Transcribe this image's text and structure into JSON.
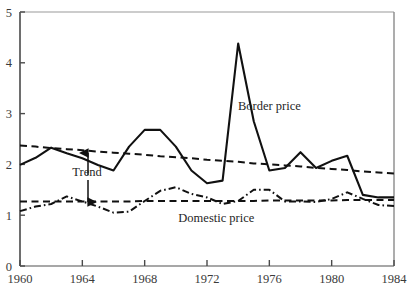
{
  "chart_data": {
    "type": "line",
    "title": "",
    "subtitle": "",
    "xlabel": "",
    "ylabel": "",
    "xlim": [
      1960,
      1984
    ],
    "ylim": [
      0,
      5
    ],
    "grid": false,
    "legend_position": "inline-annotations",
    "x_ticks": [
      "1960",
      "1964",
      "1968",
      "1972",
      "1976",
      "1980",
      "1984"
    ],
    "x_tick_values": [
      1960,
      1964,
      1968,
      1972,
      1976,
      1980,
      1984
    ],
    "y_ticks": [
      "0",
      "1",
      "2",
      "3",
      "4",
      "5"
    ],
    "y_tick_values": [
      0,
      1,
      2,
      3,
      4,
      5
    ],
    "x": [
      1960,
      1961,
      1962,
      1963,
      1964,
      1965,
      1966,
      1967,
      1968,
      1969,
      1970,
      1971,
      1972,
      1973,
      1974,
      1975,
      1976,
      1977,
      1978,
      1979,
      1980,
      1981,
      1982,
      1983,
      1984
    ],
    "series": [
      {
        "name": "Border price",
        "style": "solid",
        "color": "#111111",
        "values": [
          1.99,
          2.13,
          2.33,
          2.22,
          2.12,
          1.99,
          1.88,
          2.35,
          2.68,
          2.68,
          2.35,
          1.88,
          1.63,
          1.68,
          4.38,
          2.85,
          1.88,
          1.93,
          2.24,
          1.93,
          2.07,
          2.17,
          1.4,
          1.35,
          1.35
        ]
      },
      {
        "name": "Domestic price",
        "style": "dash-dot",
        "color": "#111111",
        "values": [
          1.08,
          1.17,
          1.22,
          1.37,
          1.27,
          1.17,
          1.05,
          1.07,
          1.28,
          1.48,
          1.55,
          1.42,
          1.35,
          1.22,
          1.28,
          1.5,
          1.5,
          1.27,
          1.27,
          1.26,
          1.32,
          1.45,
          1.32,
          1.2,
          1.18
        ]
      },
      {
        "name": "Border price trend",
        "style": "dashed",
        "color": "#111111",
        "values": [
          2.37,
          2.35,
          2.32,
          2.3,
          2.28,
          2.25,
          2.23,
          2.21,
          2.19,
          2.16,
          2.14,
          2.12,
          2.09,
          2.07,
          2.05,
          2.02,
          2.0,
          1.98,
          1.96,
          1.93,
          1.91,
          1.89,
          1.86,
          1.84,
          1.82
        ]
      },
      {
        "name": "Domestic price trend",
        "style": "dashed",
        "color": "#111111",
        "values": [
          1.27,
          1.27,
          1.27,
          1.27,
          1.27,
          1.27,
          1.27,
          1.27,
          1.28,
          1.28,
          1.28,
          1.28,
          1.28,
          1.28,
          1.28,
          1.28,
          1.29,
          1.29,
          1.29,
          1.29,
          1.29,
          1.3,
          1.3,
          1.3,
          1.3
        ]
      }
    ],
    "annotations": [
      {
        "text": "Border price",
        "x": 1976.0,
        "y": 3.08
      },
      {
        "text": "Domestic price",
        "x": 1972.6,
        "y": 0.87
      },
      {
        "text": "Trend",
        "x": 1964.3,
        "y": 1.78
      }
    ]
  },
  "axes": {
    "y_axis_name": "value-axis",
    "x_axis_name": "year-axis"
  }
}
